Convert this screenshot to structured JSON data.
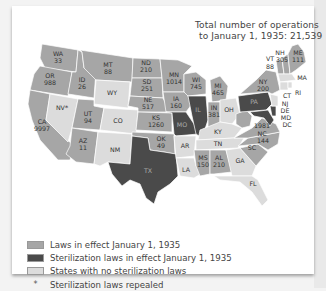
{
  "title": {
    "line1": "Total number of operations",
    "line2": "to January 1, 1935: 21,539"
  },
  "colors": {
    "laws_in_effect": "#a6a6a6",
    "laws_in_effect_dark": "#4a4a4a",
    "no_laws": "#dcdcdc",
    "border": "#ffffff",
    "background": "#ffffff"
  },
  "legend": [
    {
      "label": "Laws in effect January 1, 1935",
      "swatch": "#a6a6a6"
    },
    {
      "label": "Sterilization laws in effect January 1, 1935",
      "swatch": "#4a4a4a"
    },
    {
      "label": "States with no sterilization laws",
      "swatch": "#dcdcdc"
    },
    {
      "symbol": "*",
      "label": "Sterilization laws repealed"
    }
  ],
  "states": {
    "WA": {
      "abbr": "WA",
      "value": "33"
    },
    "OR": {
      "abbr": "OR",
      "value": "988"
    },
    "CA": {
      "abbr": "CA",
      "value": "9997"
    },
    "NV": {
      "abbr": "NV*",
      "value": ""
    },
    "ID": {
      "abbr": "ID",
      "value": "26"
    },
    "MT": {
      "abbr": "MT",
      "value": "88"
    },
    "WY": {
      "abbr": "WY",
      "value": ""
    },
    "UT": {
      "abbr": "UT",
      "value": "94"
    },
    "AZ": {
      "abbr": "AZ",
      "value": "11"
    },
    "CO": {
      "abbr": "CO",
      "value": ""
    },
    "NM": {
      "abbr": "NM",
      "value": ""
    },
    "ND": {
      "abbr": "ND",
      "value": "210"
    },
    "SD": {
      "abbr": "SD",
      "value": "251"
    },
    "NE": {
      "abbr": "NE",
      "value": "517"
    },
    "KS": {
      "abbr": "KS",
      "value": "1260"
    },
    "OK": {
      "abbr": "OK",
      "value": "49"
    },
    "TX": {
      "abbr": "TX",
      "value": ""
    },
    "MN": {
      "abbr": "MN",
      "value": "1014"
    },
    "IA": {
      "abbr": "IA",
      "value": "160"
    },
    "MO": {
      "abbr": "MO",
      "value": ""
    },
    "AR": {
      "abbr": "AR",
      "value": ""
    },
    "LA": {
      "abbr": "LA",
      "value": ""
    },
    "WI": {
      "abbr": "WI",
      "value": "745"
    },
    "IL": {
      "abbr": "IL",
      "value": ""
    },
    "MI": {
      "abbr": "MI",
      "value": "465"
    },
    "IN": {
      "abbr": "IN",
      "value": "381"
    },
    "OH": {
      "abbr": "OH",
      "value": ""
    },
    "KY": {
      "abbr": "KY",
      "value": ""
    },
    "TN": {
      "abbr": "TN",
      "value": ""
    },
    "MS": {
      "abbr": "MS",
      "value": "150"
    },
    "AL": {
      "abbr": "AL",
      "value": "210"
    },
    "GA": {
      "abbr": "GA",
      "value": ""
    },
    "FL": {
      "abbr": "FL",
      "value": ""
    },
    "SC": {
      "abbr": "SC",
      "value": ""
    },
    "NC": {
      "abbr": "NC",
      "value": "144"
    },
    "VA": {
      "abbr": "",
      "value": "1981"
    },
    "WV": {
      "abbr": "",
      "value": ""
    },
    "PA": {
      "abbr": "PA",
      "value": ""
    },
    "NY": {
      "abbr": "NY",
      "value": "200"
    },
    "VT": {
      "abbr": "VT",
      "value": "88"
    },
    "NH": {
      "abbr": "NH",
      "value": "305"
    },
    "ME": {
      "abbr": "ME",
      "value": "111"
    },
    "MA": {
      "abbr": "MA",
      "value": ""
    },
    "CT": {
      "abbr": "CT",
      "value": ""
    },
    "RI": {
      "abbr": "RI",
      "value": ""
    },
    "NJ": {
      "abbr": "NJ",
      "value": ""
    },
    "DE": {
      "abbr": "DE",
      "value": ""
    },
    "MD": {
      "abbr": "MD",
      "value": ""
    },
    "DC": {
      "abbr": "DC",
      "value": ""
    }
  }
}
